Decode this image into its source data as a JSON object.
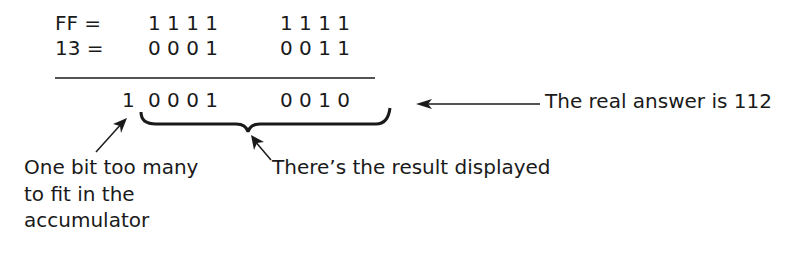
{
  "rows": [
    {
      "label": "FF =",
      "high": "1 1 1 1",
      "low": "1 1 1 1"
    },
    {
      "label": "13 =",
      "high": "0 0 0 1",
      "low": "0 0 1 1"
    }
  ],
  "result": {
    "carry": "1",
    "high": "0 0 0 1",
    "low": "0 0 1 0"
  },
  "annotations": {
    "real_answer": "The real answer is 112",
    "result_displayed": "There’s the result displayed",
    "overflow_line1": "One bit too many",
    "overflow_line2": "to fit in the",
    "overflow_line3": "accumulator"
  }
}
